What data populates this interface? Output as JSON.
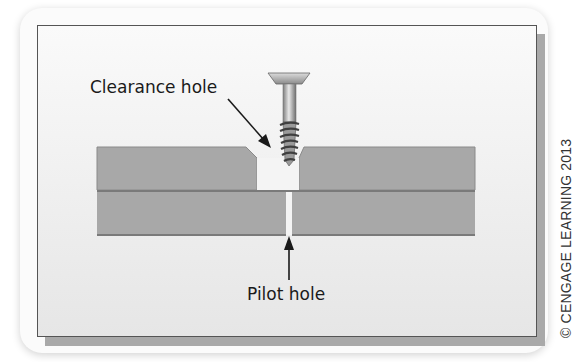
{
  "figure": {
    "labels": {
      "clearance_hole": "Clearance hole",
      "pilot_hole": "Pilot hole"
    },
    "copyright": "© CENGAGE LEARNING 2013",
    "colors": {
      "board": "#a8a8a8",
      "board_edge": "#7a7a7a",
      "panel_background": "#f2f2f2",
      "panel_border": "#555555",
      "panel_shadow": "#a9a9a9",
      "arrow": "#1a1a1a"
    },
    "elements": [
      "screw",
      "top-board-with-clearance-hole",
      "bottom-board-with-pilot-hole",
      "clearance-hole-arrow",
      "pilot-hole-arrow"
    ]
  }
}
